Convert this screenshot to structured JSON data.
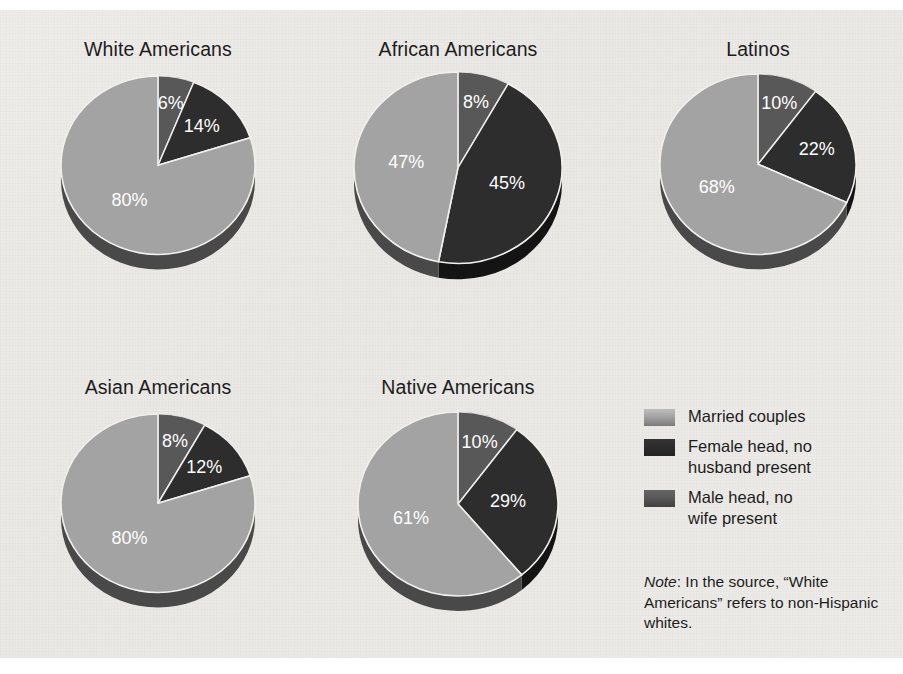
{
  "chart_data": {
    "type": "pie",
    "title": "",
    "categories": [
      "Married couples",
      "Female head, no husband present",
      "Male head, no wife present"
    ],
    "legend_position": "bottom-right",
    "note": "Note: In the source, “White Americans” refers to non-Hispanic whites.",
    "note_italic_word": "Note",
    "note_rest": ": In the source, “White Americans” refers to non-Hispanic whites.",
    "charts": [
      {
        "title": "White Americans",
        "slices": [
          {
            "category": "Male head, no wife present",
            "value": 6,
            "label": "6%",
            "color": "#585858"
          },
          {
            "category": "Female head, no husband present",
            "value": 14,
            "label": "14%",
            "color": "#2d2d2d"
          },
          {
            "category": "Married couples",
            "value": 80,
            "label": "80%",
            "color": "#a3a3a3"
          }
        ]
      },
      {
        "title": "African Americans",
        "slices": [
          {
            "category": "Male head, no wife present",
            "value": 8,
            "label": "8%",
            "color": "#585858"
          },
          {
            "category": "Female head, no husband present",
            "value": 45,
            "label": "45%",
            "color": "#2d2d2d"
          },
          {
            "category": "Married couples",
            "value": 47,
            "label": "47%",
            "color": "#a3a3a3"
          }
        ]
      },
      {
        "title": "Latinos",
        "slices": [
          {
            "category": "Male head, no wife present",
            "value": 10,
            "label": "10%",
            "color": "#585858"
          },
          {
            "category": "Female head, no husband present",
            "value": 22,
            "label": "22%",
            "color": "#2d2d2d"
          },
          {
            "category": "Married couples",
            "value": 68,
            "label": "68%",
            "color": "#a3a3a3"
          }
        ]
      },
      {
        "title": "Asian Americans",
        "slices": [
          {
            "category": "Male head, no wife present",
            "value": 8,
            "label": "8%",
            "color": "#585858"
          },
          {
            "category": "Female head, no husband present",
            "value": 12,
            "label": "12%",
            "color": "#2d2d2d"
          },
          {
            "category": "Married couples",
            "value": 80,
            "label": "80%",
            "color": "#a3a3a3"
          }
        ]
      },
      {
        "title": "Native Americans",
        "slices": [
          {
            "category": "Male head, no wife present",
            "value": 10,
            "label": "10%",
            "color": "#585858"
          },
          {
            "category": "Female head, no husband present",
            "value": 29,
            "label": "29%",
            "color": "#2d2d2d"
          },
          {
            "category": "Married couples",
            "value": 61,
            "label": "61%",
            "color": "#a3a3a3"
          }
        ]
      }
    ]
  },
  "panels": [
    {
      "title": "White Americans",
      "left": 18,
      "top": 28,
      "width": 280,
      "pie_top": 60,
      "radius": 97,
      "depth": 15
    },
    {
      "title": "African Americans",
      "left": 318,
      "top": 28,
      "width": 280,
      "pie_top": 56,
      "radius": 104,
      "depth": 16
    },
    {
      "title": "Latinos",
      "left": 618,
      "top": 28,
      "width": 280,
      "pie_top": 58,
      "radius": 98,
      "depth": 15
    },
    {
      "title": "Asian Americans",
      "left": 18,
      "top": 366,
      "width": 280,
      "pie_top": 398,
      "radius": 97,
      "depth": 15
    },
    {
      "title": "Native Americans",
      "left": 318,
      "top": 366,
      "width": 280,
      "pie_top": 396,
      "radius": 100,
      "depth": 15
    }
  ],
  "legend": {
    "items": [
      {
        "label": "Married couples",
        "color": "#a3a3a3"
      },
      {
        "label": "Female head, no\nhusband present",
        "color": "#2d2d2d"
      },
      {
        "label": "Male head, no\nwife present",
        "color": "#585858"
      }
    ]
  },
  "colors": {
    "background": "#ebe9e6",
    "married": "#a3a3a3",
    "female_head": "#2d2d2d",
    "male_head": "#585858",
    "text": "#1d1d1d",
    "slice_label": "#ffffff",
    "pie_side_shadow": "#1e1e1e"
  }
}
